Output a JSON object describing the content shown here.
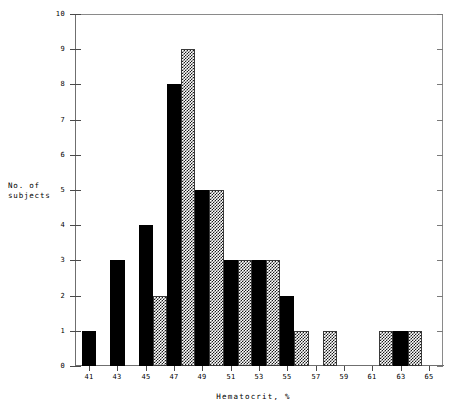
{
  "chart_data": {
    "type": "bar",
    "title": "",
    "subtitle": "",
    "xlabel": "Hematocrit, %",
    "ylabel": "No. of\nsubjects",
    "ylim": [
      0,
      10
    ],
    "xlim": [
      40,
      66
    ],
    "grid": false,
    "legend": "none",
    "y_ticks": [
      0,
      1,
      2,
      3,
      4,
      5,
      6,
      7,
      8,
      9,
      10
    ],
    "y_tick_labels": [
      "0",
      "1",
      "2",
      "3",
      "4",
      "5",
      "6",
      "7",
      "8",
      "9",
      "10"
    ],
    "x_ticks": [
      41,
      43,
      45,
      47,
      49,
      51,
      53,
      55,
      57,
      59,
      61,
      63,
      65
    ],
    "x_tick_labels": [
      "41",
      "43",
      "45",
      "47",
      "49",
      "51",
      "53",
      "55",
      "57",
      "59",
      "61",
      "63",
      "65"
    ],
    "categories": [
      41,
      42,
      43,
      44,
      45,
      46,
      47,
      48,
      49,
      50,
      51,
      52,
      53,
      54,
      55,
      56,
      57,
      58,
      59,
      60,
      61,
      62,
      63,
      64,
      65
    ],
    "values": [
      1,
      0,
      3,
      0,
      4,
      2,
      8,
      9,
      5,
      5,
      3,
      3,
      3,
      3,
      2,
      1,
      0,
      1,
      0,
      0,
      0,
      1,
      1,
      1,
      0
    ],
    "bars": [
      {
        "x": 41,
        "value": 1,
        "fill": "solid"
      },
      {
        "x": 43,
        "value": 3,
        "fill": "solid"
      },
      {
        "x": 45,
        "value": 4,
        "fill": "solid"
      },
      {
        "x": 46,
        "value": 2,
        "fill": "checker"
      },
      {
        "x": 47,
        "value": 8,
        "fill": "solid"
      },
      {
        "x": 48,
        "value": 9,
        "fill": "checker"
      },
      {
        "x": 49,
        "value": 5,
        "fill": "solid"
      },
      {
        "x": 50,
        "value": 5,
        "fill": "checker"
      },
      {
        "x": 51,
        "value": 3,
        "fill": "solid"
      },
      {
        "x": 52,
        "value": 3,
        "fill": "checker"
      },
      {
        "x": 53,
        "value": 3,
        "fill": "solid"
      },
      {
        "x": 54,
        "value": 3,
        "fill": "checker"
      },
      {
        "x": 55,
        "value": 2,
        "fill": "solid"
      },
      {
        "x": 56,
        "value": 1,
        "fill": "checker"
      },
      {
        "x": 58,
        "value": 1,
        "fill": "checker"
      },
      {
        "x": 62,
        "value": 1,
        "fill": "checker"
      },
      {
        "x": 63,
        "value": 1,
        "fill": "solid"
      },
      {
        "x": 64,
        "value": 1,
        "fill": "checker"
      }
    ],
    "colors": {
      "solid_fill": "#000000",
      "checker_fill": "#1a1a1a",
      "background": "#ffffff",
      "axis": "#6f6f6f"
    }
  }
}
